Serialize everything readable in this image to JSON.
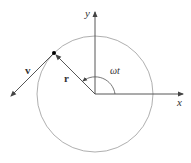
{
  "diagram": {
    "type": "uniform-circular-motion",
    "labels": {
      "x_axis": "x",
      "y_axis": "y",
      "position_vector": "r",
      "velocity_vector": "v",
      "angle": "ωt"
    },
    "colors": {
      "axes": "#444444",
      "circle": "#999999",
      "vectors": "#444444",
      "point": "#000000"
    }
  }
}
